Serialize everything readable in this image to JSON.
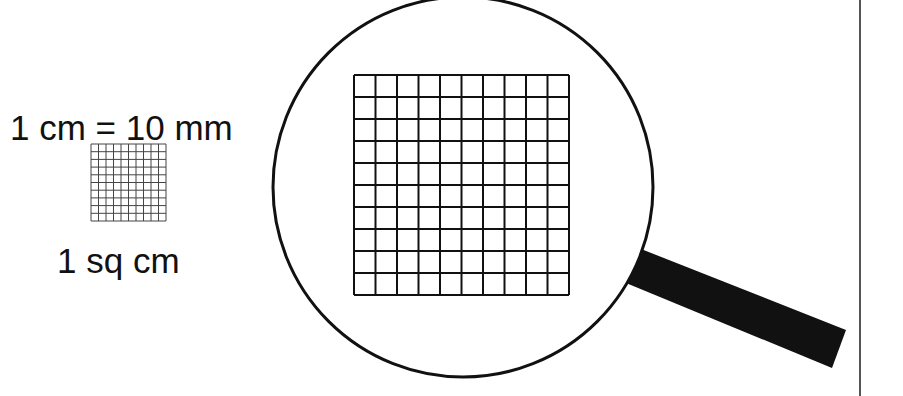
{
  "labels": {
    "equivalence": "1 cm = 10 mm",
    "area": "1 sq cm"
  },
  "small_grid": {
    "rows": 10,
    "cols": 10,
    "x": 91,
    "y": 144,
    "w": 75,
    "h": 77
  },
  "magnified_grid": {
    "rows": 10,
    "cols": 10,
    "x": 354,
    "y": 75,
    "w": 215,
    "h": 220
  },
  "magnifier": {
    "cx": 463,
    "cy": 187,
    "r": 190
  },
  "colors": {
    "ink": "#111111",
    "background": "#ffffff",
    "divider": "#555555"
  }
}
